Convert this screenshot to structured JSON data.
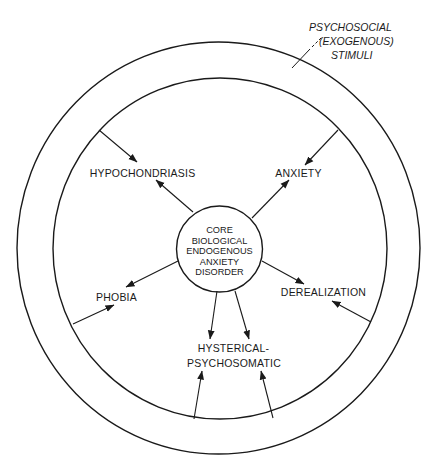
{
  "diagram": {
    "outer_label": {
      "lines": [
        "PSYCHOSOCIAL",
        "(EXOGENOUS)",
        "STIMULI"
      ]
    },
    "core": {
      "lines": [
        "CORE",
        "BIOLOGICAL",
        "ENDOGENOUS",
        "ANXIETY",
        "DISORDER"
      ]
    },
    "nodes": {
      "hypochondriasis": "HYPOCHONDRIASIS",
      "anxiety": "ANXIETY",
      "phobia": "PHOBIA",
      "derealization": "DEREALIZATION",
      "hysterical_line1": "HYSTERICAL-",
      "hysterical_line2": "PSYCHOSOMATIC"
    },
    "edges": [
      {
        "from": "core",
        "to": "HYPOCHONDRIASIS"
      },
      {
        "from": "core",
        "to": "ANXIETY"
      },
      {
        "from": "core",
        "to": "PHOBIA"
      },
      {
        "from": "core",
        "to": "DEREALIZATION"
      },
      {
        "from": "core",
        "to": "HYSTERICAL-PSYCHOSOMATIC"
      },
      {
        "from": "core",
        "to": "HYSTERICAL-PSYCHOSOMATIC"
      },
      {
        "from": "psychosocial ring",
        "to": "HYPOCHONDRIASIS"
      },
      {
        "from": "psychosocial ring",
        "to": "ANXIETY"
      },
      {
        "from": "psychosocial ring",
        "to": "PHOBIA"
      },
      {
        "from": "psychosocial ring",
        "to": "DEREALIZATION"
      },
      {
        "from": "psychosocial ring",
        "to": "HYSTERICAL-PSYCHOSOMATIC"
      },
      {
        "from": "psychosocial ring",
        "to": "HYSTERICAL-PSYCHOSOMATIC"
      }
    ]
  }
}
